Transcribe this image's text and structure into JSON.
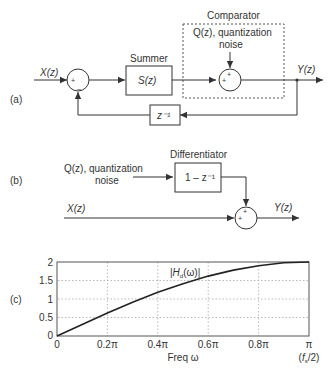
{
  "panel_a": {
    "label": "(a)",
    "input": "X(z)",
    "output": "Y(z)",
    "summer_title": "Summer",
    "summer_block": "S(z)",
    "comparator_title": "Comparator",
    "noise_line1": "Q(z), quantization",
    "noise_line2": "noise",
    "delay_block": "z⁻¹",
    "sum1_plus": "+",
    "sum1_minus": "–",
    "sum2_plus_left": "+",
    "sum2_plus_top": "+"
  },
  "panel_b": {
    "label": "(b)",
    "noise_line1": "Q(z), quantization",
    "noise_line2": "noise",
    "diff_title": "Differentiator",
    "diff_block": "1 – z⁻¹",
    "input": "X(z)",
    "output": "Y(z)",
    "sum_plus_left": "+",
    "sum_plus_top": "+"
  },
  "panel_c": {
    "label": "(c)",
    "curve_label": "|H_d(ω)|",
    "xlabel": "Freq ω",
    "fs_label": "(f_s/2)"
  },
  "chart_data": {
    "type": "line",
    "title": "",
    "xlabel": "Freq ω",
    "ylabel": "",
    "x_tick_labels": [
      "0",
      "0.2π",
      "0.4π",
      "0.6π",
      "0.8π",
      "π"
    ],
    "y_tick_labels": [
      "0",
      "0.5",
      "1",
      "1.5",
      "2"
    ],
    "xlim": [
      0,
      1
    ],
    "ylim": [
      0,
      2
    ],
    "grid": true,
    "annotations": [
      "|H_d(ω)|",
      "(f_s/2)"
    ],
    "series": [
      {
        "name": "|H_d(ω)|",
        "x": [
          0,
          0.1,
          0.2,
          0.3,
          0.4,
          0.5,
          0.6,
          0.7,
          0.8,
          0.9,
          1.0
        ],
        "values": [
          0,
          0.31,
          0.62,
          0.91,
          1.18,
          1.41,
          1.62,
          1.78,
          1.9,
          1.98,
          2.0
        ]
      }
    ]
  }
}
